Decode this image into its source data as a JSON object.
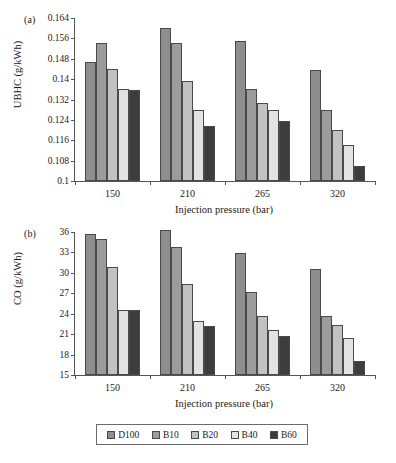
{
  "figure": {
    "panels": [
      {
        "tag": "(a)",
        "ylabel": "UBHC (g/kWh)",
        "xlabel": "Injection pressure (bar)"
      },
      {
        "tag": "(b)",
        "ylabel": "CO (g/kWh)",
        "xlabel": "Injection pressure (bar)"
      }
    ],
    "legend": {
      "items": [
        {
          "label": "D100",
          "color": "#8e8e8e"
        },
        {
          "label": "B10",
          "color": "#9c9c9c"
        },
        {
          "label": "B20",
          "color": "#c2c2c2"
        },
        {
          "label": "B40",
          "color": "#e3e3e3"
        },
        {
          "label": "B60",
          "color": "#3d3d3d"
        }
      ]
    }
  },
  "chart_data": [
    {
      "type": "bar",
      "panel": "(a)",
      "title": "",
      "xlabel": "Injection pressure (bar)",
      "ylabel": "UBHC (g/kWh)",
      "categories": [
        "150",
        "210",
        "265",
        "320"
      ],
      "ylim": [
        0.1,
        0.164
      ],
      "yticks": [
        "0.1",
        "0.108",
        "0.116",
        "0.124",
        "0.132",
        "0.14",
        "0.148",
        "0.156",
        "0.164"
      ],
      "ytick_values": [
        0.1,
        0.108,
        0.116,
        0.124,
        0.132,
        0.14,
        0.148,
        0.156,
        0.164
      ],
      "grid": false,
      "legend_position": "bottom",
      "series": [
        {
          "name": "D100",
          "color": "#8e8e8e",
          "values": [
            0.1468,
            0.1602,
            0.1548,
            0.1434
          ]
        },
        {
          "name": "B10",
          "color": "#9c9c9c",
          "values": [
            0.1542,
            0.1542,
            0.1362,
            0.128
          ]
        },
        {
          "name": "B20",
          "color": "#c2c2c2",
          "values": [
            0.144,
            0.1392,
            0.1308,
            0.12
          ]
        },
        {
          "name": "B40",
          "color": "#e3e3e3",
          "values": [
            0.136,
            0.1278,
            0.1278,
            0.1142
          ]
        },
        {
          "name": "B60",
          "color": "#3d3d3d",
          "values": [
            0.1358,
            0.1216,
            0.1234,
            0.106
          ]
        }
      ]
    },
    {
      "type": "bar",
      "panel": "(b)",
      "title": "",
      "xlabel": "Injection pressure (bar)",
      "ylabel": "CO (g/kWh)",
      "categories": [
        "150",
        "210",
        "265",
        "320"
      ],
      "ylim": [
        15,
        36
      ],
      "yticks": [
        "15",
        "18",
        "21",
        "24",
        "27",
        "30",
        "33",
        "36"
      ],
      "ytick_values": [
        15,
        18,
        21,
        24,
        27,
        30,
        33,
        36
      ],
      "grid": false,
      "legend_position": "bottom",
      "series": [
        {
          "name": "D100",
          "color": "#8e8e8e",
          "values": [
            35.7,
            36.3,
            32.9,
            30.6
          ]
        },
        {
          "name": "B10",
          "color": "#9c9c9c",
          "values": [
            35.0,
            33.8,
            27.2,
            23.6
          ]
        },
        {
          "name": "B20",
          "color": "#c2c2c2",
          "values": [
            30.8,
            28.4,
            23.6,
            22.3
          ]
        },
        {
          "name": "B40",
          "color": "#e3e3e3",
          "values": [
            24.5,
            23.0,
            21.6,
            20.4
          ]
        },
        {
          "name": "B60",
          "color": "#3d3d3d",
          "values": [
            24.5,
            22.2,
            20.8,
            17.0
          ]
        }
      ]
    }
  ]
}
